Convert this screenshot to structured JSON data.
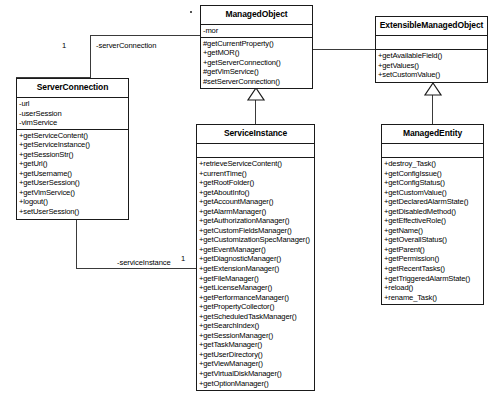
{
  "diagram": {
    "type": "uml-class-diagram",
    "classes": [
      {
        "id": "managed-object",
        "name": "ManagedObject",
        "attributes": [
          "-mor"
        ],
        "operations": [
          "#getCurrentProperty()",
          "+getMOR()",
          "+getServerConnection()",
          "#getVimService()",
          "#setServerConnection()"
        ]
      },
      {
        "id": "extensible-managed-object",
        "name": "ExtensibleManagedObject",
        "attributes": [],
        "operations": [
          "+getAvailableField()",
          "+getValues()",
          "+setCustomValue()"
        ]
      },
      {
        "id": "server-connection",
        "name": "ServerConnection",
        "attributes": [
          "-url",
          "-userSession",
          "-vimService"
        ],
        "operations": [
          "+getServiceContent()",
          "+getServiceInstance()",
          "+getSessionStr()",
          "+getUrl()",
          "+getUsername()",
          "+getUserSession()",
          "+getVimService()",
          "+logout()",
          "+setUserSession()"
        ]
      },
      {
        "id": "service-instance",
        "name": "ServiceInstance",
        "attributes": [],
        "operations": [
          "+retrieveServiceContent()",
          "+currentTime()",
          "+getRootFolder()",
          "+getAboutInfo()",
          "+getAccountManager()",
          "+getAlarmManager()",
          "+getAuthorizationManager()",
          "+getCustomFieldsManager()",
          "+getCustomizationSpecManager()",
          "+getEventManager()",
          "+getDiagnosticManager()",
          "+getExtensionManager()",
          "+getFileManager()",
          "+getLicenseManager()",
          "+getPerformanceManager()",
          "+getPropertyCollector()",
          "+getScheduledTaskManager()",
          "+getSearchIndex()",
          "+getSessionManager()",
          "+getTaskManager()",
          "+getUserDirectory()",
          "+getViewManager()",
          "+getVirtualDiskManager()",
          "+getOptionManager()"
        ]
      },
      {
        "id": "managed-entity",
        "name": "ManagedEntity",
        "attributes": [],
        "operations": [
          "+destroy_Task()",
          "+getConfigIssue()",
          "+getConfigStatus()",
          "+getCustomValue()",
          "+getDeclaredAlarmState()",
          "+getDisabledMethod()",
          "+getEffectiveRole()",
          "+getName()",
          "+getOverallStatus()",
          "+getParent()",
          "+getPermission()",
          "+getRecentTasks()",
          "+getTriggeredAlarmState()",
          "+reload()",
          "+rename_Task()"
        ]
      }
    ],
    "associations": [
      {
        "id": "server-connection-assoc",
        "label": "-serverConnection",
        "source_multiplicity": "1",
        "target_multiplicity": "",
        "from": "managed-object",
        "to": "server-connection"
      },
      {
        "id": "service-instance-assoc",
        "label": "-serviceInstance",
        "source_multiplicity": "1",
        "target_multiplicity": "1",
        "from": "server-connection",
        "to": "service-instance"
      }
    ],
    "generalizations": [
      {
        "id": "gen-service-instance",
        "child": "service-instance",
        "parent": "managed-object"
      },
      {
        "id": "gen-extensible",
        "child": "extensible-managed-object",
        "parent": "managed-object"
      },
      {
        "id": "gen-managed-entity",
        "child": "managed-entity",
        "parent": "extensible-managed-object"
      }
    ],
    "colors": {
      "stroke": "#1a1a1a",
      "connector": "#3a3a3a",
      "background": "#ffffff",
      "text": "#000000"
    }
  }
}
